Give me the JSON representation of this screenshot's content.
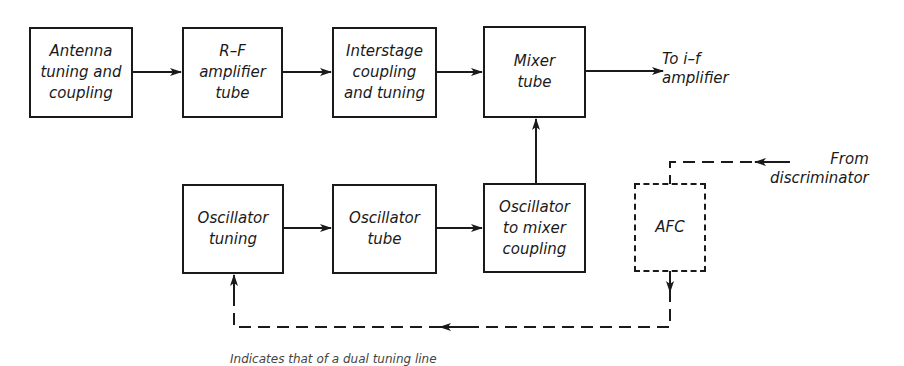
{
  "diagram": {
    "type": "block-diagram",
    "colors": {
      "line": "#1a1a1a",
      "background": "#ffffff"
    },
    "blocks": {
      "antenna": "Antenna\ntuning and\ncoupling",
      "rf_amp": "R–F\namplifier\ntube",
      "interstage": "Interstage\ncoupling\nand tuning",
      "mixer": "Mixer\ntube",
      "osc_tuning": "Oscillator\ntuning",
      "osc_tube": "Oscillator\ntube",
      "osc_mixer_coupling": "Oscillator\nto mixer\ncoupling",
      "afc": "AFC"
    },
    "labels": {
      "to_if": "To i–f\namplifier",
      "from_discriminator": "From\ndiscriminator"
    },
    "footnote": "Indicates that of a dual tuning line"
  }
}
